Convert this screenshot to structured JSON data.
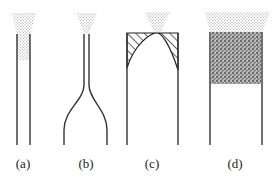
{
  "panels": [
    {
      "id": "a",
      "label": "(a)",
      "description": "narrow straight tube with powder funnel feeding into top"
    },
    {
      "id": "b",
      "label": "(b)",
      "description": "narrow neck flaring out to wide tube"
    },
    {
      "id": "c",
      "label": "(c)",
      "description": "wide tube with hatched arch at top under funnel"
    },
    {
      "id": "d",
      "label": "(d)",
      "description": "wide tube with packed dense powder plug at top"
    }
  ],
  "colors": {
    "line": "#333333",
    "powder": "#9a9a9a",
    "dense": "#555555"
  }
}
